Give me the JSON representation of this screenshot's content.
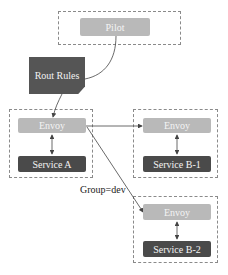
{
  "diagram": {
    "nodes": {
      "pilot": {
        "label": "Pilot"
      },
      "rout_rules": {
        "label": "Rout Rules"
      },
      "envoy_a": {
        "label": "Envoy"
      },
      "service_a": {
        "label": "Service A"
      },
      "envoy_b1": {
        "label": "Envoy"
      },
      "service_b1": {
        "label": "Service B-1"
      },
      "envoy_b2": {
        "label": "Envoy"
      },
      "service_b2": {
        "label": "Service B-2"
      }
    },
    "edge_labels": {
      "group_dev": "Group=dev"
    },
    "colors": {
      "light_node": "#b9b9b9",
      "dark_node": "#4a4a4a",
      "doc_node": "#555555",
      "dashed_border": "#8a8a8a",
      "line": "#444444"
    }
  }
}
